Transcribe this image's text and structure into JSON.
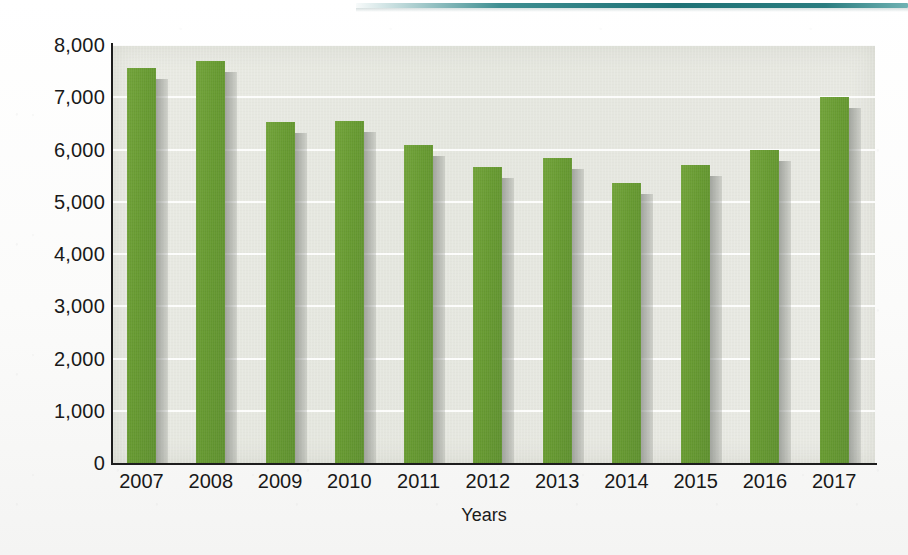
{
  "chart_data": {
    "type": "bar",
    "title": "",
    "subtitle": "",
    "xlabel": "Years",
    "ylabel": "",
    "categories": [
      "2007",
      "2008",
      "2009",
      "2010",
      "2011",
      "2012",
      "2013",
      "2014",
      "2015",
      "2016",
      "2017"
    ],
    "values": [
      7560,
      7690,
      6530,
      6550,
      6090,
      5670,
      5840,
      5360,
      5700,
      5990,
      7010
    ],
    "series": [
      {
        "name": "",
        "values": [
          7560,
          7690,
          6530,
          6550,
          6090,
          5670,
          5840,
          5360,
          5700,
          5990,
          7010
        ]
      }
    ],
    "ylim": [
      0,
      8000
    ],
    "ytick_values": [
      0,
      1000,
      2000,
      3000,
      4000,
      5000,
      6000,
      7000,
      8000
    ],
    "ytick_labels": [
      "0",
      "1,000",
      "2,000",
      "3,000",
      "4,000",
      "5,000",
      "6,000",
      "7,000",
      "8,000"
    ],
    "xtick_labels": [
      "2007",
      "2008",
      "2009",
      "2010",
      "2011",
      "2012",
      "2013",
      "2014",
      "2015",
      "2016",
      "2017"
    ],
    "grid": true,
    "grid_axis": "y",
    "legend": false,
    "legend_position": "none",
    "annotations": [],
    "bar_color": "#679a31",
    "plot_background": "#e7e8e1",
    "axis_color": "#1d1d1d",
    "page_background": "#fdfdfd",
    "edge_strip_color": "#2b7d80"
  }
}
